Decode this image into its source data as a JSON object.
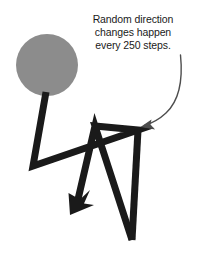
{
  "figure": {
    "background_color": "#ffffff",
    "width": 198,
    "height": 261
  },
  "annotation": {
    "text": "Random direction\nchanges happen\nevery 250 steps.",
    "line1": "Random direction",
    "line2": "changes happen",
    "line3": "every 250 steps.",
    "color": "#1a1a1a",
    "font_size_px": 10.5
  },
  "shapes": {
    "start_blob": {
      "name": "start-region-circle",
      "fill_color": "#8c8c8c",
      "center_x": 47,
      "center_y": 65,
      "radius": 31
    },
    "walk_path": {
      "name": "random-walk-path",
      "stroke_color": "#1a1a1a",
      "stroke_width": 7,
      "vertices": [
        [
          46,
          96
        ],
        [
          33,
          166
        ],
        [
          138,
          130
        ],
        [
          95,
          126
        ],
        [
          132,
          240
        ],
        [
          95,
          126
        ],
        [
          72,
          212
        ]
      ]
    },
    "walk_arrowheads": [
      {
        "name": "walk-arrowhead-lower",
        "tip_x": 70,
        "tip_y": 214,
        "direction_deg": 248,
        "fill_color": "#1a1a1a"
      }
    ],
    "callout_arrow": {
      "name": "callout-curved-arrow",
      "stroke_color": "#4d4d4d",
      "stroke_width": 1.4,
      "start_x": 180,
      "start_y": 56,
      "end_x": 142,
      "end_y": 126,
      "tip_direction_deg": 215
    }
  },
  "colors": {
    "ink": "#1a1a1a",
    "gray_blob": "#8c8c8c",
    "thin_arrow": "#4d4d4d",
    "background": "#ffffff"
  }
}
